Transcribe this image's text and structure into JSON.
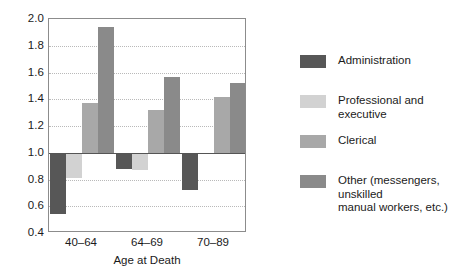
{
  "chart_data": {
    "type": "bar",
    "title": "",
    "xlabel": "Age at Death",
    "ylabel": "",
    "categories": [
      "40–64",
      "64–69",
      "70–89"
    ],
    "ylim": [
      0.4,
      2.0
    ],
    "yticks": [
      "0.4",
      "0.6",
      "0.8",
      "1.0",
      "1.2",
      "1.4",
      "1.6",
      "1.8",
      "2.0"
    ],
    "ytick_values": [
      0.4,
      0.6,
      0.8,
      1.0,
      1.2,
      1.4,
      1.6,
      1.8,
      2.0
    ],
    "baseline": 1.0,
    "grid": true,
    "legend_position": "right",
    "series": [
      {
        "name": "Administration",
        "color": "#575757",
        "values": [
          0.54,
          0.88,
          0.72
        ]
      },
      {
        "name": "Professional and executive",
        "color": "#d2d2d2",
        "values": [
          0.81,
          0.87,
          0.99
        ]
      },
      {
        "name": "Clerical",
        "color": "#a8a8a8",
        "values": [
          1.37,
          1.32,
          1.42
        ]
      },
      {
        "name": "Other (messengers, unskilled manual workers, etc.)",
        "color": "#8a8a8a",
        "values": [
          1.94,
          1.57,
          1.52
        ]
      }
    ]
  },
  "axes": {
    "x_title": "Age at Death",
    "x_tick_labels": [
      "40–64",
      "64–69",
      "70–89"
    ],
    "y_tick_labels": [
      "2.0",
      "1.8",
      "1.6",
      "1.4",
      "1.2",
      "1.0",
      "0.8",
      "0.6",
      "0.4"
    ]
  },
  "legend": {
    "items": [
      {
        "label": "Administration",
        "color": "#575757"
      },
      {
        "label": "Professional and executive",
        "color": "#d2d2d2"
      },
      {
        "label": "Clerical",
        "color": "#a8a8a8"
      },
      {
        "label": "Other (messengers, unskilled\nmanual workers, etc.)",
        "color": "#8a8a8a"
      }
    ]
  }
}
